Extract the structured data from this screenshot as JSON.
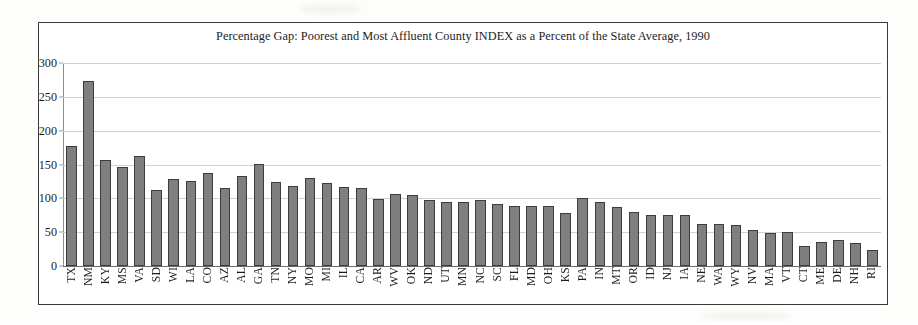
{
  "chart_data": {
    "type": "bar",
    "title": "Percentage Gap: Poorest and Most Affluent County INDEX as a Percent of the State Average, 1990",
    "xlabel": "",
    "ylabel": "",
    "ylim": [
      0,
      300
    ],
    "yticks": [
      0,
      50,
      100,
      150,
      200,
      250,
      300
    ],
    "grid": true,
    "legend": "none",
    "bar_color": "#7f7f7f",
    "bar_border_color": "#3d3d3d",
    "categories": [
      "TX",
      "NM",
      "KY",
      "MS",
      "VA",
      "SD",
      "WI",
      "LA",
      "CO",
      "AZ",
      "AL",
      "GA",
      "TN",
      "NY",
      "MO",
      "MI",
      "IL",
      "CA",
      "AR",
      "WV",
      "OK",
      "ND",
      "UT",
      "MN",
      "NC",
      "SC",
      "FL",
      "MD",
      "OH",
      "KS",
      "PA",
      "IN",
      "MT",
      "OR",
      "ID",
      "NJ",
      "IA",
      "NE",
      "WA",
      "WY",
      "NV",
      "MA",
      "VT",
      "CT",
      "ME",
      "DE",
      "NH",
      "RI"
    ],
    "values": [
      178,
      274,
      156,
      147,
      162,
      113,
      128,
      125,
      138,
      115,
      133,
      151,
      124,
      118,
      130,
      122,
      117,
      115,
      99,
      106,
      105,
      97,
      94,
      94,
      98,
      91,
      89,
      88,
      88,
      78,
      101,
      95,
      87,
      80,
      76,
      75,
      75,
      62,
      62,
      61,
      53,
      49,
      51,
      29,
      36,
      39,
      34,
      24
    ]
  },
  "axis": {
    "y_tick_labels": [
      "300",
      "250",
      "200",
      "150",
      "100",
      "50",
      "0"
    ]
  }
}
